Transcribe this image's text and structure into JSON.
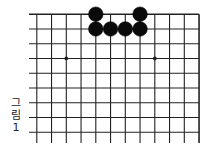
{
  "diagram": {
    "type": "go-board-partial",
    "caption": [
      "그",
      "림",
      "1"
    ],
    "caption_text": "그림 1",
    "board": {
      "columns_visible": 12,
      "rows_visible": 9,
      "edges": [
        "top",
        "right"
      ],
      "star_points": [
        {
          "col": 3,
          "row": 4
        },
        {
          "col": 9,
          "row": 4
        }
      ],
      "stones": [
        {
          "color": "black",
          "col": 5,
          "row": 1
        },
        {
          "color": "black",
          "col": 8,
          "row": 1
        },
        {
          "color": "black",
          "col": 5,
          "row": 2
        },
        {
          "color": "black",
          "col": 6,
          "row": 2
        },
        {
          "color": "black",
          "col": 7,
          "row": 2
        },
        {
          "color": "black",
          "col": 8,
          "row": 2
        }
      ]
    },
    "colors": {
      "line": "#222222",
      "stone_black": "#0a0a0a",
      "background": "#ffffff"
    }
  }
}
